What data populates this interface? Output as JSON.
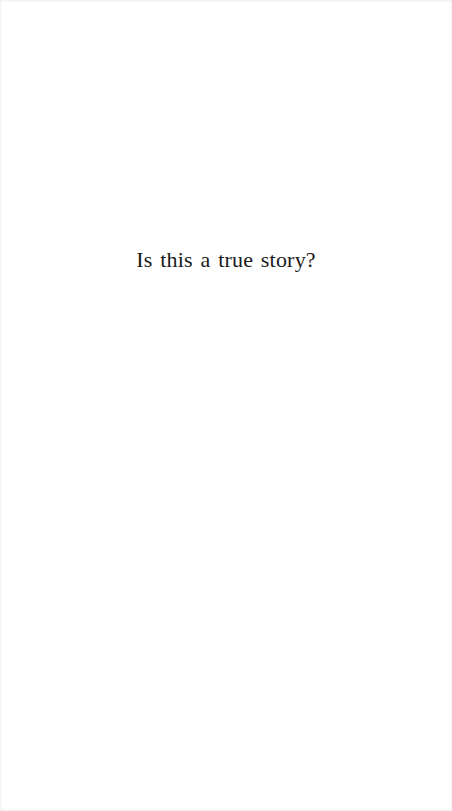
{
  "page": {
    "text": "Is this a true story?",
    "text_color": "#1a1a1a",
    "background": "#ffffff"
  }
}
